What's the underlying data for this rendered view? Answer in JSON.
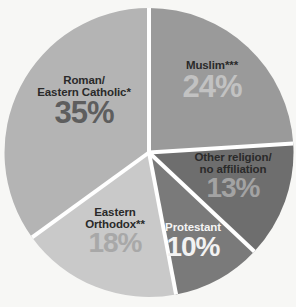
{
  "chart_data": {
    "type": "pie",
    "title": "",
    "subtitle": "",
    "xlabel": "",
    "ylabel": "",
    "legend_position": "none",
    "grid": false,
    "units": "percent",
    "start_angle_deg": 0,
    "direction": "clockwise",
    "categories": [
      "Muslim***",
      "Other religion/\nno affiliation",
      "Protestant",
      "Eastern\nOrthodox**",
      "Roman/\nEastern Catholic*"
    ],
    "values": [
      24,
      13,
      10,
      18,
      35
    ],
    "slices": [
      {
        "name": "muslim",
        "label": "Muslim***",
        "value": 24,
        "value_text": "24%",
        "color": "#9a9a9a",
        "pct_text_color": "#c2c2c2"
      },
      {
        "name": "other-religion",
        "label": "Other religion/\nno affiliation",
        "value": 13,
        "value_text": "13%",
        "color": "#6e6e6e",
        "pct_text_color": "#a3a3a3"
      },
      {
        "name": "protestant",
        "label": "Protestant",
        "value": 10,
        "value_text": "10%",
        "color": "#7a7a7a",
        "pct_text_color": "#f2f2f2"
      },
      {
        "name": "eastern-orthodox",
        "label": "Eastern\nOrthodox**",
        "value": 18,
        "value_text": "18%",
        "color": "#c9c9c9",
        "pct_text_color": "#a8a8a8"
      },
      {
        "name": "roman-eastern-catholic",
        "label": "Roman/\nEastern Catholic*",
        "value": 35,
        "value_text": "35%",
        "color": "#b4b4b4",
        "pct_text_color": "#5e5e5e"
      }
    ]
  },
  "colors": {
    "background": "#f7f7f5",
    "separator": "#ffffff",
    "muslim": "#9a9a9a",
    "other_religion": "#6e6e6e",
    "protestant": "#7a7a7a",
    "eastern_orthodox": "#c9c9c9",
    "roman_eastern_catholic": "#b4b4b4"
  }
}
